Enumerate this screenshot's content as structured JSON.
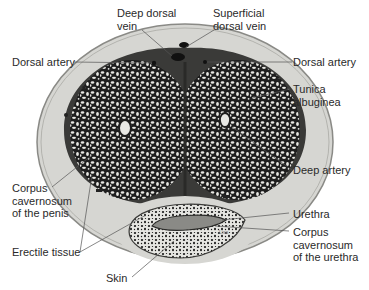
{
  "figure": {
    "colors": {
      "skin_fill": "#d6d6d2",
      "skin_edge": "#8a8a86",
      "tunica": "#3a3a38",
      "erectile_dark": "#1e1e1e",
      "erectile_light": "#e8e8e4",
      "background": "#ffffff",
      "leader": "#555555"
    },
    "signature": "Lisa",
    "labels": {
      "deep_dorsal_vein": [
        "Deep dorsal",
        "vein"
      ],
      "superficial_dorsal_vein": [
        "Superficial",
        "dorsal vein"
      ],
      "dorsal_artery_left": "Dorsal artery",
      "dorsal_artery_right": "Dorsal artery",
      "tunica_albuginea": [
        "Tunica",
        "albuginea"
      ],
      "deep_artery": "Deep artery",
      "corpus_cavernosum_penis": [
        "Corpus",
        "cavernosum",
        "of the penis"
      ],
      "urethra": "Urethra",
      "corpus_cavernosum_urethra": [
        "Corpus",
        "cavernosum",
        "of the urethra"
      ],
      "erectile_tissue": "Erectile tissue",
      "skin": "Skin"
    }
  }
}
